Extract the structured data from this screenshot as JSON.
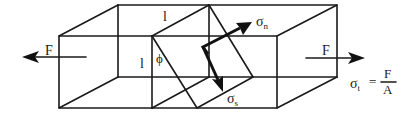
{
  "figure": {
    "colors": {
      "line": "#1a1a1a",
      "background": "#ffffff"
    }
  },
  "labels": {
    "force_left": "F",
    "force_right": "F",
    "length_top": "l",
    "length_side": "l",
    "angle": "ϕ",
    "sigma_n": "σ",
    "sigma_n_sub": "n",
    "sigma_s": "σ",
    "sigma_s_sub": "s",
    "sigma_t": "σ",
    "sigma_t_sub": "t",
    "equals": "=",
    "frac_num": "F",
    "frac_den": "A"
  }
}
